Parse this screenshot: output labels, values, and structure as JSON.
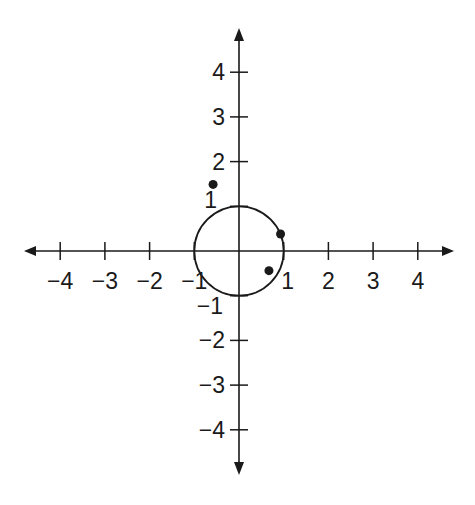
{
  "diagram": {
    "type": "coordinate-plane",
    "origin_px": [
      239,
      251
    ],
    "unit_px": 44.7,
    "x_ticks": [
      {
        "value": -4,
        "label": "−4"
      },
      {
        "value": -3,
        "label": "−3"
      },
      {
        "value": -2,
        "label": "−2"
      },
      {
        "value": -1,
        "label": "−1"
      },
      {
        "value": 1,
        "label": "1"
      },
      {
        "value": 2,
        "label": "2"
      },
      {
        "value": 3,
        "label": "3"
      },
      {
        "value": 4,
        "label": "4"
      }
    ],
    "y_ticks": [
      {
        "value": 4,
        "label": "4"
      },
      {
        "value": 3,
        "label": "3"
      },
      {
        "value": 2,
        "label": "2"
      },
      {
        "value": 1,
        "label": "1"
      },
      {
        "value": -1,
        "label": "−1"
      },
      {
        "value": -2,
        "label": "−2"
      },
      {
        "value": -3,
        "label": "−3"
      },
      {
        "value": -4,
        "label": "−4"
      }
    ],
    "circle": {
      "center": [
        0,
        0
      ],
      "radius": 1
    },
    "points": [
      {
        "name": "point-a",
        "x": -0.58,
        "y": 1.49
      },
      {
        "name": "point-b",
        "x": 0.93,
        "y": 0.38
      },
      {
        "name": "point-c",
        "x": 0.67,
        "y": -0.44
      }
    ],
    "colors": {
      "stroke": "#1a1a1a",
      "background": "#ffffff"
    }
  }
}
